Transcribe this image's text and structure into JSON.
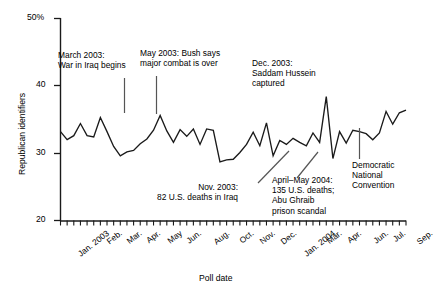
{
  "chart_data": {
    "type": "line",
    "title": "",
    "xlabel": "Poll date",
    "ylabel": "Republican identifiers",
    "ylim": [
      20,
      50
    ],
    "yticks": [
      20,
      30,
      40,
      50
    ],
    "yticklabels": [
      "20",
      "30",
      "40",
      "50%"
    ],
    "grid": false,
    "legend": null,
    "xticklabels": [
      "Jan. 2003",
      "Feb.",
      "Mar.",
      "Apr.",
      "May",
      "Jun.",
      "Aug.",
      "Oct.",
      "Nov.",
      "Dec.",
      "Jan. 2004",
      "Mar.",
      "Apr.",
      "Jun.",
      "Jul.",
      "Sep."
    ],
    "xtick_positions": [
      0,
      3,
      6,
      9,
      12,
      15,
      19,
      23,
      26,
      29,
      32,
      36,
      39,
      43,
      46,
      50
    ],
    "n_points": 53,
    "values": [
      33.2,
      32.0,
      32.6,
      34.4,
      32.6,
      32.4,
      35.3,
      33.2,
      31.0,
      29.6,
      30.2,
      30.4,
      31.4,
      32.1,
      33.4,
      35.6,
      33.3,
      31.6,
      33.5,
      32.5,
      33.6,
      31.3,
      33.6,
      33.4,
      28.7,
      29.0,
      29.1,
      30.1,
      31.3,
      33.1,
      31.1,
      34.5,
      29.6,
      31.9,
      31.3,
      32.2,
      31.6,
      31.1,
      33.0,
      31.6,
      38.4,
      29.2,
      33.2,
      31.5,
      33.4,
      33.2,
      32.9,
      32.0,
      33.0,
      36.2,
      34.3,
      36.0,
      36.4
    ],
    "annotations": [
      {
        "id": "march-2003-war",
        "lines": [
          "March 2003:",
          "War in Iraq begins"
        ]
      },
      {
        "id": "may-2003-combat",
        "lines": [
          "May 2003: Bush says",
          "major combat is over"
        ]
      },
      {
        "id": "dec-2003-saddam",
        "lines": [
          "Dec. 2003:",
          "Saddam Hussein",
          "captured"
        ]
      },
      {
        "id": "nov-2003-deaths",
        "lines": [
          "Nov. 2003:",
          "82 U.S. deaths in Iraq"
        ]
      },
      {
        "id": "april-may-2004-abu-ghraib",
        "lines": [
          "April–May 2004:",
          "135 U.S. deaths;",
          "Abu Ghraib",
          "prison scandal"
        ]
      },
      {
        "id": "democratic-national-convention",
        "lines": [
          "Democratic",
          "National",
          "Convention"
        ]
      }
    ]
  },
  "axis": {
    "y_label": "Republican identifiers",
    "x_label": "Poll date",
    "y_tick_50": "50%",
    "y_tick_40": "40",
    "y_tick_30": "30",
    "y_tick_20": "20"
  },
  "xticks": {
    "t0": "Jan. 2003",
    "t1": "Feb.",
    "t2": "Mar.",
    "t3": "Apr.",
    "t4": "May",
    "t5": "Jun.",
    "t6": "Aug.",
    "t7": "Oct.",
    "t8": "Nov.",
    "t9": "Dec.",
    "t10": "Jan. 2004",
    "t11": "Mar.",
    "t12": "Apr.",
    "t13": "Jun.",
    "t14": "Jul.",
    "t15": "Sep."
  },
  "annotations": {
    "march_war_l1": "March 2003:",
    "march_war_l2": "War in Iraq begins",
    "may_combat_l1": "May 2003: Bush says",
    "may_combat_l2": "major combat is over",
    "dec_saddam_l1": "Dec. 2003:",
    "dec_saddam_l2": "Saddam Hussein",
    "dec_saddam_l3": "captured",
    "nov_deaths_l1": "Nov. 2003:",
    "nov_deaths_l2": "82 U.S. deaths in Iraq",
    "abu_l1": "April–May 2004:",
    "abu_l2": "135 U.S. deaths;",
    "abu_l3": "Abu Ghraib",
    "abu_l4": "prison scandal",
    "dnc_l1": "Democratic",
    "dnc_l2": "National",
    "dnc_l3": "Convention"
  },
  "colors": {
    "line": "#1a1a1a",
    "axis": "#1a1a1a",
    "background": "#ffffff"
  }
}
